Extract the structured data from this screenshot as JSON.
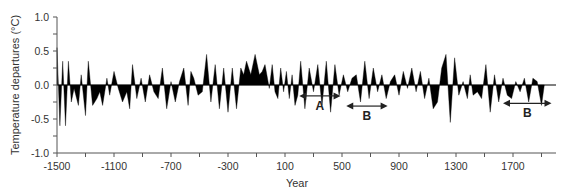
{
  "chart_data": {
    "type": "area",
    "title": "",
    "xlabel": "Year",
    "ylabel": "Temperature departures (°C)",
    "xlim": [
      -1500,
      1950
    ],
    "ylim": [
      -1.0,
      1.0
    ],
    "x_ticks": [
      -1500,
      -1300,
      -1100,
      -900,
      -700,
      -500,
      -300,
      -100,
      100,
      300,
      500,
      700,
      900,
      1100,
      1300,
      1500,
      1700,
      1900
    ],
    "x_tick_labels": [
      "-1500",
      "-1100",
      "-700",
      "-300",
      "100",
      "500",
      "900",
      "1300",
      "1700"
    ],
    "y_ticks": [
      1.0,
      0.75,
      0.5,
      0.25,
      0.0,
      -0.25,
      -0.5,
      -0.75,
      -1.0
    ],
    "y_tick_labels": [
      "1.0",
      "0.5",
      "0.0",
      "-0.5",
      "-1.0"
    ],
    "grid": false,
    "fill_color": "#000000",
    "series": [
      {
        "name": "Temperature departures",
        "x": [
          -1500,
          -1480,
          -1460,
          -1440,
          -1420,
          -1400,
          -1380,
          -1350,
          -1330,
          -1300,
          -1280,
          -1250,
          -1220,
          -1200,
          -1180,
          -1150,
          -1130,
          -1100,
          -1070,
          -1040,
          -1010,
          -990,
          -970,
          -940,
          -910,
          -880,
          -850,
          -820,
          -790,
          -760,
          -730,
          -700,
          -670,
          -640,
          -610,
          -580,
          -560,
          -540,
          -510,
          -480,
          -450,
          -420,
          -390,
          -360,
          -330,
          -300,
          -270,
          -240,
          -210,
          -190,
          -170,
          -140,
          -110,
          -80,
          -60,
          -40,
          -10,
          10,
          30,
          50,
          70,
          90,
          110,
          130,
          150,
          170,
          190,
          210,
          240,
          270,
          300,
          330,
          360,
          390,
          420,
          450,
          480,
          510,
          540,
          570,
          600,
          630,
          660,
          690,
          720,
          750,
          780,
          810,
          840,
          870,
          900,
          930,
          960,
          990,
          1020,
          1050,
          1080,
          1110,
          1140,
          1170,
          1200,
          1230,
          1260,
          1290,
          1320,
          1350,
          1380,
          1400,
          1420,
          1450,
          1480,
          1510,
          1540,
          1570,
          1600,
          1630,
          1660,
          1690,
          1720,
          1750,
          1780,
          1810,
          1840,
          1870,
          1900,
          1920
        ],
        "values": [
          0.55,
          -0.6,
          0.35,
          -0.6,
          0.35,
          -0.25,
          -0.05,
          -0.3,
          0.15,
          -0.45,
          0.35,
          -0.3,
          -0.2,
          -0.1,
          -0.3,
          0.1,
          -0.15,
          0.2,
          -0.05,
          -0.25,
          -0.1,
          -0.35,
          0.3,
          -0.2,
          0.1,
          -0.25,
          0.15,
          -0.1,
          -0.2,
          0.25,
          -0.35,
          0.05,
          -0.25,
          0.05,
          0.25,
          -0.3,
          0.2,
          0.1,
          -0.15,
          -0.1,
          0.45,
          -0.25,
          0.3,
          -0.35,
          0.25,
          -0.4,
          0.25,
          -0.35,
          0.25,
          0.15,
          0.35,
          0.15,
          0.45,
          0.15,
          0.2,
          0.3,
          -0.05,
          0.3,
          -0.1,
          -0.2,
          0.25,
          -0.1,
          0.2,
          -0.2,
          0.15,
          -0.3,
          -0.15,
          0.35,
          -0.35,
          0.25,
          -0.1,
          0.3,
          -0.3,
          0.35,
          -0.4,
          0.3,
          -0.15,
          0.15,
          -0.1,
          0.1,
          0.15,
          -0.25,
          0.35,
          -0.2,
          0.25,
          -0.1,
          0.15,
          -0.2,
          0.05,
          0.15,
          -0.15,
          0.2,
          -0.05,
          0.25,
          -0.1,
          0.2,
          -0.2,
          0.1,
          -0.35,
          -0.25,
          0.25,
          0.45,
          -0.55,
          0.4,
          -0.15,
          0.05,
          -0.2,
          0.15,
          -0.15,
          -0.1,
          -0.2,
          0.3,
          -0.4,
          0.15,
          -0.25,
          0.1,
          -0.15,
          -0.2,
          0.05,
          -0.1,
          0.1,
          -0.25,
          0.1,
          0.05,
          -0.3,
          0
        ]
      }
    ],
    "annotations": [
      {
        "label": "A",
        "x_start": 200,
        "x_end": 490,
        "y": -0.16
      },
      {
        "label": "B",
        "x_start": 530,
        "x_end": 820,
        "y": -0.31
      },
      {
        "label": "B",
        "x_start": 1630,
        "x_end": 1970,
        "y": -0.27
      }
    ]
  }
}
